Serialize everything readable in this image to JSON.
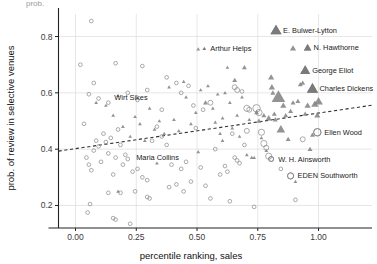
{
  "figure": {
    "clipped_top_fragment": "prob.",
    "background_color": "#ffffff",
    "marker_color": "#7a7a7a",
    "grid_color": "#dddddd",
    "axis_color": "#222222",
    "trend_color": "#333333"
  },
  "chart_data": {
    "type": "scatter",
    "title": "",
    "xlabel": "percentile ranking, sales",
    "ylabel": "prob. of review in selective venues",
    "xlim": [
      -0.07,
      1.22
    ],
    "ylim": [
      0.12,
      0.88
    ],
    "xticks": [
      0.0,
      0.25,
      0.5,
      0.75,
      1.0
    ],
    "xticklabels": [
      "0.00",
      "0.25",
      "0.50",
      "0.75",
      "1.00"
    ],
    "yticks": [
      0.2,
      0.4,
      0.6,
      0.8
    ],
    "yticklabels": [
      "0.2",
      "0.4",
      "0.6",
      "0.8"
    ],
    "grid": true,
    "legend": "none",
    "trendline": {
      "type": "dashed-linear",
      "x_start": -0.07,
      "y_start": 0.393,
      "x_end": 1.22,
      "y_end": 0.556
    },
    "series": [
      {
        "name": "male authors",
        "marker": "triangle",
        "fill": "#808080",
        "points": [
          {
            "x": 0.825,
            "y": 0.822,
            "size": 9
          },
          {
            "x": 0.895,
            "y": 0.758,
            "size": 5
          },
          {
            "x": 0.955,
            "y": 0.76,
            "size": 6
          },
          {
            "x": 0.945,
            "y": 0.68,
            "size": 8
          },
          {
            "x": 0.975,
            "y": 0.615,
            "size": 9
          },
          {
            "x": 0.085,
            "y": 0.565,
            "size": 3
          },
          {
            "x": 0.125,
            "y": 0.555,
            "size": 3
          },
          {
            "x": 0.155,
            "y": 0.52,
            "size": 3
          },
          {
            "x": 0.175,
            "y": 0.59,
            "size": 3
          },
          {
            "x": 0.195,
            "y": 0.48,
            "size": 3
          },
          {
            "x": 0.225,
            "y": 0.445,
            "size": 3
          },
          {
            "x": 0.245,
            "y": 0.515,
            "size": 3
          },
          {
            "x": 0.265,
            "y": 0.49,
            "size": 3
          },
          {
            "x": 0.285,
            "y": 0.43,
            "size": 3
          },
          {
            "x": 0.305,
            "y": 0.545,
            "size": 3
          },
          {
            "x": 0.325,
            "y": 0.47,
            "size": 3
          },
          {
            "x": 0.345,
            "y": 0.5,
            "size": 3
          },
          {
            "x": 0.365,
            "y": 0.455,
            "size": 3
          },
          {
            "x": 0.385,
            "y": 0.62,
            "size": 3
          },
          {
            "x": 0.405,
            "y": 0.505,
            "size": 3
          },
          {
            "x": 0.425,
            "y": 0.465,
            "size": 3
          },
          {
            "x": 0.445,
            "y": 0.64,
            "size": 3
          },
          {
            "x": 0.455,
            "y": 0.585,
            "size": 3
          },
          {
            "x": 0.475,
            "y": 0.49,
            "size": 3
          },
          {
            "x": 0.495,
            "y": 0.53,
            "size": 3
          },
          {
            "x": 0.505,
            "y": 0.755,
            "size": 3
          },
          {
            "x": 0.515,
            "y": 0.61,
            "size": 3
          },
          {
            "x": 0.535,
            "y": 0.565,
            "size": 4
          },
          {
            "x": 0.545,
            "y": 0.625,
            "size": 3
          },
          {
            "x": 0.565,
            "y": 0.545,
            "size": 3
          },
          {
            "x": 0.575,
            "y": 0.495,
            "size": 3
          },
          {
            "x": 0.585,
            "y": 0.595,
            "size": 3
          },
          {
            "x": 0.595,
            "y": 0.455,
            "size": 3
          },
          {
            "x": 0.605,
            "y": 0.51,
            "size": 3
          },
          {
            "x": 0.615,
            "y": 0.6,
            "size": 3
          },
          {
            "x": 0.625,
            "y": 0.69,
            "size": 3
          },
          {
            "x": 0.635,
            "y": 0.565,
            "size": 3
          },
          {
            "x": 0.645,
            "y": 0.475,
            "size": 3
          },
          {
            "x": 0.655,
            "y": 0.645,
            "size": 4
          },
          {
            "x": 0.665,
            "y": 0.52,
            "size": 3
          },
          {
            "x": 0.675,
            "y": 0.445,
            "size": 3
          },
          {
            "x": 0.685,
            "y": 0.585,
            "size": 3
          },
          {
            "x": 0.695,
            "y": 0.69,
            "size": 4
          },
          {
            "x": 0.705,
            "y": 0.38,
            "size": 3
          },
          {
            "x": 0.715,
            "y": 0.505,
            "size": 3
          },
          {
            "x": 0.725,
            "y": 0.37,
            "size": 3
          },
          {
            "x": 0.735,
            "y": 0.37,
            "size": 3
          },
          {
            "x": 0.745,
            "y": 0.53,
            "size": 4
          },
          {
            "x": 0.755,
            "y": 0.5,
            "size": 4
          },
          {
            "x": 0.765,
            "y": 0.44,
            "size": 3
          },
          {
            "x": 0.775,
            "y": 0.52,
            "size": 4
          },
          {
            "x": 0.785,
            "y": 0.395,
            "size": 3
          },
          {
            "x": 0.795,
            "y": 0.51,
            "size": 5
          },
          {
            "x": 0.805,
            "y": 0.655,
            "size": 5
          },
          {
            "x": 0.808,
            "y": 0.62,
            "size": 5
          },
          {
            "x": 0.812,
            "y": 0.6,
            "size": 4
          },
          {
            "x": 0.818,
            "y": 0.525,
            "size": 4
          },
          {
            "x": 0.822,
            "y": 0.505,
            "size": 4
          },
          {
            "x": 0.835,
            "y": 0.585,
            "size": 11
          },
          {
            "x": 0.845,
            "y": 0.47,
            "size": 7
          },
          {
            "x": 0.855,
            "y": 0.555,
            "size": 5
          },
          {
            "x": 0.865,
            "y": 0.52,
            "size": 4
          },
          {
            "x": 0.875,
            "y": 0.435,
            "size": 4
          },
          {
            "x": 0.885,
            "y": 0.535,
            "size": 4
          },
          {
            "x": 0.895,
            "y": 0.565,
            "size": 4
          },
          {
            "x": 0.905,
            "y": 0.285,
            "size": 3
          },
          {
            "x": 0.915,
            "y": 0.57,
            "size": 4
          },
          {
            "x": 0.925,
            "y": 0.63,
            "size": 4
          },
          {
            "x": 0.935,
            "y": 0.635,
            "size": 4
          },
          {
            "x": 0.945,
            "y": 0.525,
            "size": 4
          },
          {
            "x": 0.955,
            "y": 0.555,
            "size": 5
          },
          {
            "x": 0.965,
            "y": 0.4,
            "size": 4
          },
          {
            "x": 0.975,
            "y": 0.45,
            "size": 4
          },
          {
            "x": 0.985,
            "y": 0.56,
            "size": 6
          },
          {
            "x": 0.995,
            "y": 0.52,
            "size": 5
          },
          {
            "x": 1.0,
            "y": 0.57,
            "size": 7
          },
          {
            "x": 0.175,
            "y": 0.25,
            "size": 3
          },
          {
            "x": 0.335,
            "y": 0.35,
            "size": 3
          },
          {
            "x": 0.505,
            "y": 0.39,
            "size": 3
          },
          {
            "x": 0.605,
            "y": 0.43,
            "size": 3
          }
        ]
      },
      {
        "name": "female authors",
        "marker": "circle-open",
        "stroke": "#8a8a8a",
        "points": [
          {
            "x": 0.065,
            "y": 0.855,
            "size": 3
          },
          {
            "x": 0.02,
            "y": 0.7,
            "size": 3
          },
          {
            "x": 0.165,
            "y": 0.705,
            "size": 3
          },
          {
            "x": 0.275,
            "y": 0.695,
            "size": 3
          },
          {
            "x": 0.075,
            "y": 0.635,
            "size": 3
          },
          {
            "x": 0.055,
            "y": 0.595,
            "size": 3
          },
          {
            "x": 0.095,
            "y": 0.58,
            "size": 3
          },
          {
            "x": 0.135,
            "y": 0.565,
            "size": 3
          },
          {
            "x": 0.215,
            "y": 0.6,
            "size": 3
          },
          {
            "x": 0.255,
            "y": 0.575,
            "size": 3
          },
          {
            "x": 0.295,
            "y": 0.61,
            "size": 3
          },
          {
            "x": 0.355,
            "y": 0.54,
            "size": 3
          },
          {
            "x": 0.375,
            "y": 0.655,
            "size": 3
          },
          {
            "x": 0.415,
            "y": 0.635,
            "size": 3
          },
          {
            "x": 0.435,
            "y": 0.6,
            "size": 3
          },
          {
            "x": 0.465,
            "y": 0.625,
            "size": 3
          },
          {
            "x": 0.485,
            "y": 0.555,
            "size": 3
          },
          {
            "x": 0.525,
            "y": 0.54,
            "size": 3
          },
          {
            "x": 0.555,
            "y": 0.565,
            "size": 4
          },
          {
            "x": 0.655,
            "y": 0.62,
            "size": 4
          },
          {
            "x": 0.665,
            "y": 0.61,
            "size": 4
          },
          {
            "x": 0.685,
            "y": 0.605,
            "size": 3
          },
          {
            "x": 0.705,
            "y": 0.545,
            "size": 5
          },
          {
            "x": 0.715,
            "y": 0.54,
            "size": 4
          },
          {
            "x": 0.745,
            "y": 0.545,
            "size": 6
          },
          {
            "x": 0.755,
            "y": 0.53,
            "size": 5
          },
          {
            "x": 0.705,
            "y": 0.465,
            "size": 4
          },
          {
            "x": 0.765,
            "y": 0.46,
            "size": 5
          },
          {
            "x": 0.775,
            "y": 0.42,
            "size": 5
          },
          {
            "x": 0.785,
            "y": 0.405,
            "size": 4
          },
          {
            "x": 0.795,
            "y": 0.375,
            "size": 5
          },
          {
            "x": 0.805,
            "y": 0.365,
            "size": 4
          },
          {
            "x": 0.845,
            "y": 0.33,
            "size": 3
          },
          {
            "x": 0.885,
            "y": 0.305,
            "size": 5
          },
          {
            "x": 0.935,
            "y": 0.435,
            "size": 4
          },
          {
            "x": 0.995,
            "y": 0.46,
            "size": 6
          },
          {
            "x": 0.035,
            "y": 0.49,
            "size": 3
          },
          {
            "x": 0.045,
            "y": 0.37,
            "size": 3
          },
          {
            "x": 0.055,
            "y": 0.345,
            "size": 3
          },
          {
            "x": 0.065,
            "y": 0.325,
            "size": 3
          },
          {
            "x": 0.075,
            "y": 0.395,
            "size": 3
          },
          {
            "x": 0.085,
            "y": 0.43,
            "size": 3
          },
          {
            "x": 0.095,
            "y": 0.41,
            "size": 3
          },
          {
            "x": 0.105,
            "y": 0.355,
            "size": 3
          },
          {
            "x": 0.115,
            "y": 0.455,
            "size": 3
          },
          {
            "x": 0.125,
            "y": 0.425,
            "size": 3
          },
          {
            "x": 0.135,
            "y": 0.385,
            "size": 3
          },
          {
            "x": 0.145,
            "y": 0.44,
            "size": 3
          },
          {
            "x": 0.155,
            "y": 0.31,
            "size": 3
          },
          {
            "x": 0.165,
            "y": 0.37,
            "size": 3
          },
          {
            "x": 0.175,
            "y": 0.47,
            "size": 3
          },
          {
            "x": 0.185,
            "y": 0.415,
            "size": 3
          },
          {
            "x": 0.195,
            "y": 0.345,
            "size": 3
          },
          {
            "x": 0.205,
            "y": 0.38,
            "size": 3
          },
          {
            "x": 0.215,
            "y": 0.365,
            "size": 3
          },
          {
            "x": 0.235,
            "y": 0.32,
            "size": 3
          },
          {
            "x": 0.255,
            "y": 0.33,
            "size": 3
          },
          {
            "x": 0.275,
            "y": 0.3,
            "size": 3
          },
          {
            "x": 0.295,
            "y": 0.29,
            "size": 3
          },
          {
            "x": 0.315,
            "y": 0.43,
            "size": 3
          },
          {
            "x": 0.335,
            "y": 0.48,
            "size": 3
          },
          {
            "x": 0.355,
            "y": 0.445,
            "size": 3
          },
          {
            "x": 0.375,
            "y": 0.415,
            "size": 3
          },
          {
            "x": 0.395,
            "y": 0.345,
            "size": 3
          },
          {
            "x": 0.415,
            "y": 0.275,
            "size": 3
          },
          {
            "x": 0.435,
            "y": 0.33,
            "size": 3
          },
          {
            "x": 0.455,
            "y": 0.355,
            "size": 3
          },
          {
            "x": 0.475,
            "y": 0.285,
            "size": 3
          },
          {
            "x": 0.495,
            "y": 0.475,
            "size": 3
          },
          {
            "x": 0.515,
            "y": 0.335,
            "size": 3
          },
          {
            "x": 0.535,
            "y": 0.27,
            "size": 3
          },
          {
            "x": 0.555,
            "y": 0.225,
            "size": 3
          },
          {
            "x": 0.575,
            "y": 0.4,
            "size": 3
          },
          {
            "x": 0.595,
            "y": 0.31,
            "size": 3
          },
          {
            "x": 0.615,
            "y": 0.34,
            "size": 3
          },
          {
            "x": 0.625,
            "y": 0.32,
            "size": 3
          },
          {
            "x": 0.635,
            "y": 0.215,
            "size": 3
          },
          {
            "x": 0.645,
            "y": 0.455,
            "size": 3
          },
          {
            "x": 0.655,
            "y": 0.37,
            "size": 3
          },
          {
            "x": 0.665,
            "y": 0.36,
            "size": 3
          },
          {
            "x": 0.675,
            "y": 0.35,
            "size": 3
          },
          {
            "x": 0.695,
            "y": 0.415,
            "size": 3
          },
          {
            "x": 0.735,
            "y": 0.195,
            "size": 3
          },
          {
            "x": 0.905,
            "y": 0.22,
            "size": 3
          },
          {
            "x": 0.06,
            "y": 0.205,
            "size": 3
          },
          {
            "x": 0.05,
            "y": 0.175,
            "size": 3
          },
          {
            "x": 0.155,
            "y": 0.155,
            "size": 3
          },
          {
            "x": 0.165,
            "y": 0.15,
            "size": 3
          },
          {
            "x": 0.225,
            "y": 0.135,
            "size": 3
          },
          {
            "x": 0.135,
            "y": 0.245,
            "size": 3
          },
          {
            "x": 0.185,
            "y": 0.245,
            "size": 3
          },
          {
            "x": 0.245,
            "y": 0.25,
            "size": 3
          },
          {
            "x": 0.295,
            "y": 0.23,
            "size": 3
          },
          {
            "x": 0.305,
            "y": 0.225,
            "size": 3
          },
          {
            "x": 0.385,
            "y": 0.265,
            "size": 3
          },
          {
            "x": 0.445,
            "y": 0.25,
            "size": 3
          }
        ]
      }
    ],
    "annotations": [
      {
        "label": "E. Bulwer-Lytton",
        "x": 0.825,
        "y": 0.822,
        "marker": "triangle",
        "size": 9,
        "dx": 7,
        "dy": 2.5
      },
      {
        "label": "N. Hawthorne",
        "x": 0.955,
        "y": 0.76,
        "marker": "triangle",
        "size": 6,
        "dx": 6,
        "dy": 2.5
      },
      {
        "label": "Arthur Helps",
        "x": 0.53,
        "y": 0.757,
        "marker": "triangle",
        "size": 3,
        "dx": 6,
        "dy": 2.5
      },
      {
        "label": "George Eliot",
        "x": 0.945,
        "y": 0.68,
        "marker": "triangle",
        "size": 8,
        "dx": 7,
        "dy": 2.5
      },
      {
        "label": "Charles Dickens",
        "x": 0.975,
        "y": 0.615,
        "marker": "triangle",
        "size": 9,
        "dx": 7,
        "dy": 2.5
      },
      {
        "label": "Wirt Sikes",
        "x": 0.135,
        "y": 0.585,
        "marker": "none",
        "size": 0,
        "dx": 6,
        "dy": 2.5
      },
      {
        "label": "Ellen Wood",
        "x": 0.995,
        "y": 0.46,
        "marker": "circle",
        "size": 6,
        "dx": 7,
        "dy": 2.5
      },
      {
        "label": "Maria Collins",
        "x": 0.225,
        "y": 0.37,
        "marker": "none",
        "size": 0,
        "dx": 6,
        "dy": 2.5
      },
      {
        "label": "W. H. Ainsworth",
        "x": 0.805,
        "y": 0.365,
        "marker": "circle",
        "size": 4,
        "dx": 7,
        "dy": 2.5
      },
      {
        "label": "EDEN Southworth",
        "x": 0.885,
        "y": 0.305,
        "marker": "circle",
        "size": 5,
        "dx": 7,
        "dy": 2.5
      }
    ]
  }
}
